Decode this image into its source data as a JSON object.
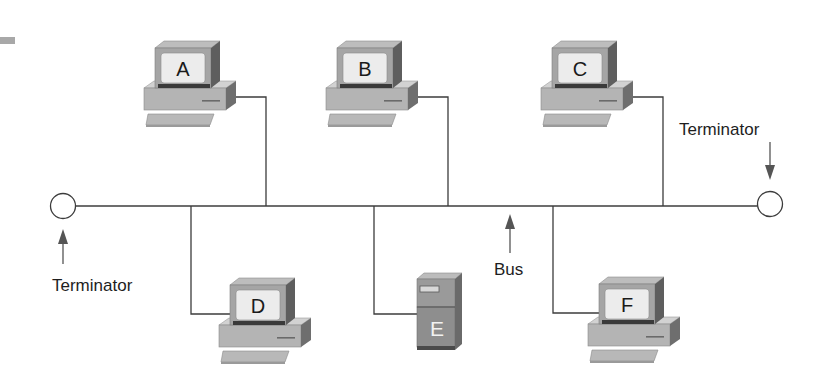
{
  "diagram": {
    "bus": {
      "label": "Bus",
      "y": 206,
      "x_start": 76,
      "x_end": 757
    },
    "terminators": [
      {
        "id": "left",
        "label": "Terminator",
        "cx": 63,
        "cy": 206
      },
      {
        "id": "right",
        "label": "Terminator",
        "cx": 770,
        "cy": 204
      }
    ],
    "nodes": [
      {
        "id": "A",
        "label": "A",
        "type": "workstation",
        "position": "top"
      },
      {
        "id": "B",
        "label": "B",
        "type": "workstation",
        "position": "top"
      },
      {
        "id": "C",
        "label": "C",
        "type": "workstation",
        "position": "top"
      },
      {
        "id": "D",
        "label": "D",
        "type": "workstation",
        "position": "bottom"
      },
      {
        "id": "E",
        "label": "E",
        "type": "server",
        "position": "bottom"
      },
      {
        "id": "F",
        "label": "F",
        "type": "workstation",
        "position": "bottom"
      }
    ],
    "colors": {
      "background": "#ffffff",
      "wire": "#3c3c3c",
      "device_light": "#c8c8c8",
      "device_mid": "#a9a9a9",
      "device_dark": "#6e6e6e",
      "screen": "#ececec",
      "server_body": "#8a8a8a"
    }
  }
}
